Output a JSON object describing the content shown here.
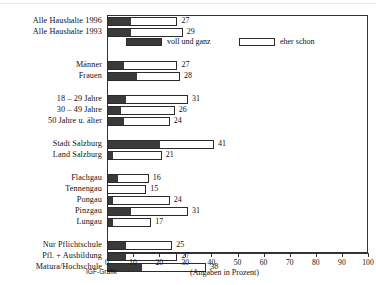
{
  "chart_data": {
    "type": "bar",
    "orientation": "horizontal",
    "stacked": true,
    "title": "",
    "xlabel": "(Angaben in Prozent)",
    "ylabel": "",
    "xlim": [
      0,
      100
    ],
    "xticks": [
      0,
      10,
      20,
      30,
      40,
      50,
      60,
      70,
      80,
      90,
      100
    ],
    "xticklabels": [
      "0",
      "10",
      "20",
      "30",
      "40",
      "50",
      "60",
      "70",
      "80",
      "90",
      "100"
    ],
    "grid": false,
    "legend_position": "top-inside",
    "credit": "IGF-Grafik",
    "legend": [
      {
        "name": "voll und ganz",
        "color": "#3a3a3a"
      },
      {
        "name": "eher schon",
        "color": "#ffffff"
      }
    ],
    "categories": [
      "Alle Haushalte 1996",
      "Alle Haushalte 1993",
      "Männer",
      "Frauen",
      "18 – 29 Jahre",
      "30 – 49 Jahre",
      "50 Jahre u. älter",
      "Stadt Salzburg",
      "Land Salzburg",
      "Flachgau",
      "Tennengau",
      "Pongau",
      "Pinzgau",
      "Lungau",
      "Nur Pflichtschule",
      "Pfl. + Ausbildung",
      "Matura/Hochschule"
    ],
    "series": [
      {
        "name": "voll und ganz",
        "values": [
          9,
          9,
          6,
          11,
          7,
          5,
          6,
          20,
          2,
          4,
          0,
          2,
          9,
          2,
          7,
          7,
          13
        ]
      },
      {
        "name": "eher schon",
        "values": [
          18,
          20,
          21,
          17,
          24,
          21,
          18,
          21,
          19,
          12,
          15,
          22,
          22,
          15,
          18,
          20,
          25
        ]
      }
    ],
    "totals": [
      27,
      29,
      27,
      28,
      31,
      26,
      24,
      41,
      21,
      16,
      15,
      24,
      31,
      17,
      25,
      27,
      38
    ],
    "groups": [
      {
        "label": "Haushalte",
        "rows": [
          0,
          1
        ]
      },
      {
        "label": "Geschlecht",
        "rows": [
          2,
          3
        ]
      },
      {
        "label": "Alter",
        "rows": [
          4,
          5,
          6
        ]
      },
      {
        "label": "Region Salzburg",
        "rows": [
          7,
          8
        ]
      },
      {
        "label": "Bezirke",
        "rows": [
          9,
          10,
          11,
          12,
          13
        ]
      },
      {
        "label": "Bildung",
        "rows": [
          14,
          15,
          16
        ]
      }
    ]
  }
}
